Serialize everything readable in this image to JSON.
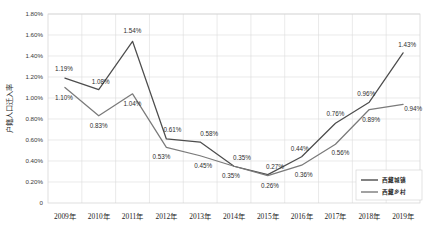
{
  "chart_data": {
    "type": "line",
    "title": "",
    "xlabel": "",
    "ylabel": "户籍人口迁入率",
    "categories": [
      "2009年",
      "2010年",
      "2011年",
      "2012年",
      "2013年",
      "2014年",
      "2015年",
      "2016年",
      "2017年",
      "2018年",
      "2019年"
    ],
    "ytick_labels": [
      "1.80%",
      "1.60%",
      "1.40%",
      "1.20%",
      "1.00%",
      "0.80%",
      "0.60%",
      "0.40%",
      "0.20%",
      "0"
    ],
    "ytick_values": [
      1.8,
      1.6,
      1.4,
      1.2,
      1.0,
      0.8,
      0.6,
      0.4,
      0.2,
      0
    ],
    "ylim": [
      0,
      1.8
    ],
    "grid": true,
    "legend_position": "bottom-right",
    "series": [
      {
        "name": "西藏城镇",
        "color": "#4d4d4d",
        "values": [
          1.19,
          1.08,
          1.54,
          0.61,
          0.58,
          0.35,
          0.27,
          0.44,
          0.76,
          0.96,
          1.43
        ],
        "labels": [
          "1.19%",
          "1.08%",
          "1.54%",
          "0.61%",
          "0.58%",
          "0.35%",
          "0.27%",
          "0.44%",
          "0.76%",
          "0.96%",
          "1.43%"
        ]
      },
      {
        "name": "西藏乡村",
        "color": "#7a7a7a",
        "values": [
          1.1,
          0.83,
          1.04,
          0.53,
          0.45,
          0.35,
          0.26,
          0.36,
          0.56,
          0.89,
          0.94
        ],
        "labels": [
          "1.10%",
          "0.83%",
          "1.04%",
          "0.53%",
          "0.45%",
          "0.35%",
          "0.26%",
          "0.36%",
          "0.56%",
          "0.89%",
          "0.94%"
        ]
      }
    ]
  }
}
